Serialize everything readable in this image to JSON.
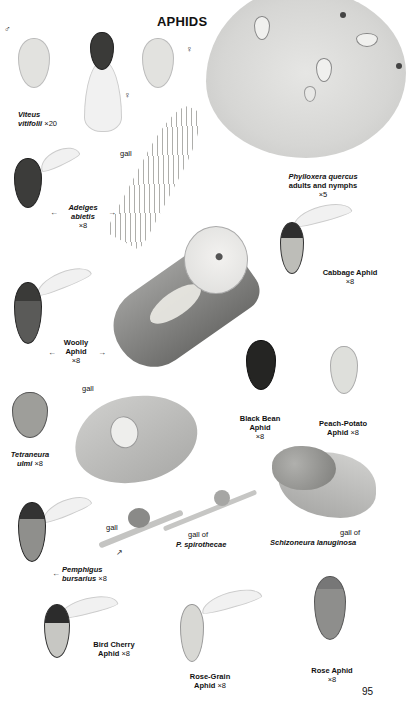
{
  "page": {
    "title": "APHIDS",
    "page_number": "95"
  },
  "symbols": {
    "male": "♂",
    "female": "♀"
  },
  "labels": {
    "viteus": {
      "line1": "Viteus",
      "line2": "vitifolii",
      "scale": "×20"
    },
    "phylloxera": {
      "line1": "Phylloxera quercus",
      "line2": "adults and nymphs",
      "scale": "×5"
    },
    "adelges": {
      "line1": "Adelges",
      "line2": "abietis",
      "scale": "×8",
      "gall": "gall"
    },
    "cabbage": {
      "line1": "Cabbage Aphid",
      "scale": "×8"
    },
    "woolly": {
      "line1": "Woolly",
      "line2": "Aphid",
      "scale": "×8"
    },
    "black_bean": {
      "line1": "Black Bean",
      "line2": "Aphid",
      "scale": "×8"
    },
    "peach_potato": {
      "line1": "Peach-Potato",
      "line2": "Aphid",
      "scale": "×8"
    },
    "tetraneura": {
      "line1": "Tetraneura",
      "line2": "ulmi",
      "scale": "×8",
      "gall": "gall"
    },
    "schizoneura": {
      "prefix": "gall of",
      "name": "Schizoneura lanuginosa"
    },
    "pemphigus": {
      "line1": "Pemphigus",
      "line2": "bursarius",
      "scale": "×8",
      "gall": "gall"
    },
    "spirothecae": {
      "prefix": "gall of",
      "name": "P. spirothecae"
    },
    "bird_cherry": {
      "line1": "Bird Cherry",
      "line2": "Aphid",
      "scale": "×8"
    },
    "rose_grain": {
      "line1": "Rose-Grain",
      "line2": "Aphid",
      "scale": "×8"
    },
    "rose": {
      "line1": "Rose Aphid",
      "scale": "×8"
    }
  },
  "arrows": {
    "left": "←",
    "right": "→",
    "up_right": "↗"
  },
  "colors": {
    "background": "#ffffff",
    "text": "#111111",
    "leaf": "#d6d6d4",
    "dark_aphid": "#2a2a2a",
    "pale_aphid": "#d9d9d5",
    "rose_aphid": "#8a8a88"
  }
}
